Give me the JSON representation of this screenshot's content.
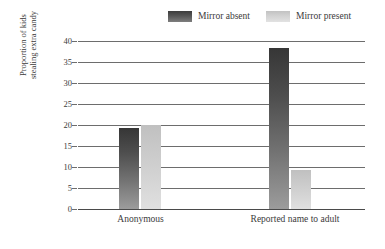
{
  "chart_data": {
    "type": "bar",
    "title": "",
    "subtitle": "",
    "xlabel": "",
    "ylabel": "Proportion of kids stealing extra candy",
    "ylabel_lines": [
      "Proportion of kids",
      "stealing extra candy"
    ],
    "categories": [
      "Anonymous",
      "Reported name to adult"
    ],
    "series": [
      {
        "name": "Mirror absent",
        "color": "#4e4e4e",
        "values": [
          19.3,
          38.3
        ]
      },
      {
        "name": "Mirror present",
        "color": "#cccccc",
        "values": [
          20.0,
          9.3
        ]
      }
    ],
    "ylim": [
      0,
      40
    ],
    "yticks": [
      0,
      5,
      10,
      15,
      20,
      25,
      30,
      35,
      40
    ],
    "ytick_labels": [
      "0",
      "5",
      "10",
      "15",
      "20",
      "25",
      "30",
      "35",
      "40"
    ],
    "grid": "horizontal",
    "legend_position": "top",
    "legend": [
      "Mirror absent",
      "Mirror present"
    ],
    "orientation": "vertical",
    "grouped": true,
    "background_color": "#ffffff",
    "axis_color": "#6d6d6d"
  },
  "legend": {
    "entries": [
      {
        "label": "Mirror absent",
        "swatch": "dark-gradient-swatch"
      },
      {
        "label": "Mirror present",
        "swatch": "light-gradient-swatch"
      }
    ]
  },
  "axes": {
    "y_title_line1": "Proportion of kids",
    "y_title_line2": "stealing extra candy",
    "y_ticks": [
      "40",
      "35",
      "30",
      "25",
      "20",
      "15",
      "10",
      "5",
      "0"
    ],
    "x_categories": [
      "Anonymous",
      "Reported name to adult"
    ]
  }
}
